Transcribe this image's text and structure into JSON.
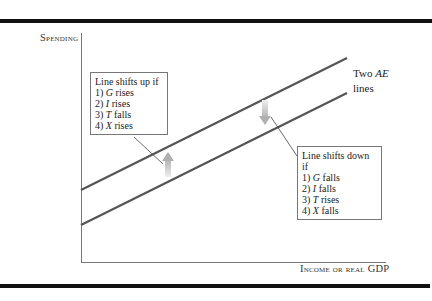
{
  "diagram": {
    "type": "aggregate-expenditure-shift",
    "axes": {
      "y_label": "Spending",
      "x_label_prefix": "Income or real",
      "x_label_suffix": "GDP"
    },
    "lines_label": {
      "prefix": "Two",
      "italic": "AE",
      "suffix": "lines"
    },
    "shift_up_box": {
      "title": "Line shifts up if",
      "items": [
        {
          "num": "1)",
          "var": "G",
          "text": "rises"
        },
        {
          "num": "2)",
          "var": "I",
          "text": "rises"
        },
        {
          "num": "3)",
          "var": "T",
          "text": "falls"
        },
        {
          "num": "4)",
          "var": "X",
          "text": "rises"
        }
      ]
    },
    "shift_down_box": {
      "title": "Line shifts down if",
      "items": [
        {
          "num": "1)",
          "var": "G",
          "text": "falls"
        },
        {
          "num": "2)",
          "var": "I",
          "text": "falls"
        },
        {
          "num": "3)",
          "var": "T",
          "text": "rises"
        },
        {
          "num": "4)",
          "var": "X",
          "text": "falls"
        }
      ]
    },
    "colors": {
      "ae_line": "#555555",
      "axis": "#777777",
      "frame_rule": "#111111",
      "arrow": "#c8c8c8"
    }
  }
}
